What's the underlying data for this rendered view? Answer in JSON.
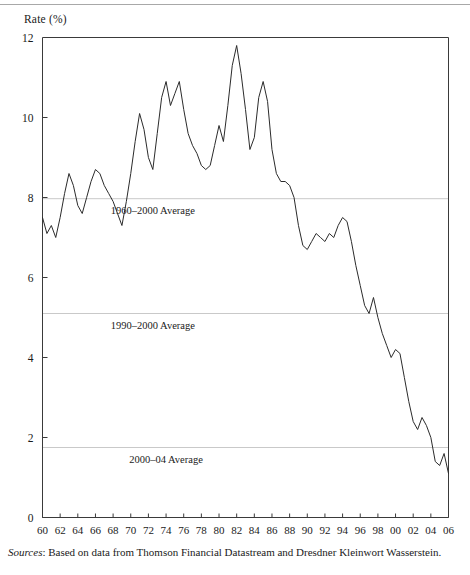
{
  "figure": {
    "y_axis_title": "Rate (%)",
    "source_label": "Sources",
    "source_separator": ": ",
    "source_text": "Based on data from Thomson Financial Datastream and Dresdner Kleinwort Wasserstein."
  },
  "chart_data": {
    "type": "line",
    "title": "",
    "subtitle": "",
    "xlabel": "",
    "ylabel": "Rate (%)",
    "xlim": [
      1960,
      2006
    ],
    "ylim": [
      0,
      12
    ],
    "grid": false,
    "legend_position": "none",
    "y_ticks": [
      0,
      2,
      4,
      6,
      8,
      10,
      12
    ],
    "y_tick_labels": [
      "0",
      "2",
      "4",
      "6",
      "8",
      "10",
      "12"
    ],
    "x_ticks": [
      1960,
      1962,
      1964,
      1966,
      1968,
      1970,
      1972,
      1974,
      1976,
      1978,
      1980,
      1982,
      1984,
      1986,
      1988,
      1990,
      1992,
      1994,
      1996,
      1998,
      2000,
      2002,
      2004,
      2006
    ],
    "x_tick_labels": [
      "60",
      "62",
      "64",
      "66",
      "68",
      "70",
      "72",
      "74",
      "76",
      "78",
      "80",
      "82",
      "84",
      "86",
      "88",
      "90",
      "92",
      "94",
      "96",
      "98",
      "00",
      "02",
      "04",
      "06"
    ],
    "line_color": "#2b2b2b",
    "reference_line_color": "#c9c9c9",
    "series": [
      {
        "name": "Rate",
        "x": [
          1960.0,
          1960.5,
          1961.0,
          1961.5,
          1962.0,
          1962.5,
          1963.0,
          1963.5,
          1964.0,
          1964.5,
          1965.0,
          1965.5,
          1966.0,
          1966.5,
          1967.0,
          1967.5,
          1968.0,
          1968.5,
          1969.0,
          1969.5,
          1970.0,
          1970.5,
          1971.0,
          1971.5,
          1972.0,
          1972.5,
          1973.0,
          1973.5,
          1974.0,
          1974.5,
          1975.0,
          1975.5,
          1976.0,
          1976.5,
          1977.0,
          1977.5,
          1978.0,
          1978.5,
          1979.0,
          1979.5,
          1980.0,
          1980.5,
          1981.0,
          1981.5,
          1982.0,
          1982.5,
          1983.0,
          1983.5,
          1984.0,
          1984.5,
          1985.0,
          1985.5,
          1986.0,
          1986.5,
          1987.0,
          1987.5,
          1988.0,
          1988.5,
          1989.0,
          1989.5,
          1990.0,
          1990.5,
          1991.0,
          1991.5,
          1992.0,
          1992.5,
          1993.0,
          1993.5,
          1994.0,
          1994.5,
          1995.0,
          1995.5,
          1996.0,
          1996.5,
          1997.0,
          1997.5,
          1998.0,
          1998.5,
          1999.0,
          1999.5,
          2000.0,
          2000.5,
          2001.0,
          2001.5,
          2002.0,
          2002.5,
          2003.0,
          2003.5,
          2004.0,
          2004.5,
          2005.0,
          2005.5,
          2006.0
        ],
        "y": [
          7.5,
          7.1,
          7.3,
          7.0,
          7.5,
          8.1,
          8.6,
          8.3,
          7.8,
          7.6,
          8.0,
          8.4,
          8.7,
          8.6,
          8.3,
          8.1,
          7.9,
          7.6,
          7.3,
          7.9,
          8.6,
          9.4,
          10.1,
          9.7,
          9.0,
          8.7,
          9.6,
          10.5,
          10.9,
          10.3,
          10.6,
          10.9,
          10.2,
          9.6,
          9.3,
          9.1,
          8.8,
          8.7,
          8.8,
          9.3,
          9.8,
          9.4,
          10.3,
          11.3,
          11.8,
          11.1,
          10.2,
          9.2,
          9.5,
          10.5,
          10.9,
          10.4,
          9.2,
          8.6,
          8.4,
          8.4,
          8.3,
          8.0,
          7.3,
          6.8,
          6.7,
          6.9,
          7.1,
          7.0,
          6.9,
          7.1,
          7.0,
          7.3,
          7.5,
          7.4,
          6.9,
          6.3,
          5.8,
          5.3,
          5.1,
          5.5,
          5.0,
          4.6,
          4.3,
          4.0,
          4.2,
          4.1,
          3.5,
          2.9,
          2.4,
          2.2,
          2.5,
          2.3,
          2.0,
          1.4,
          1.3,
          1.6,
          1.1
        ]
      }
    ],
    "reference_lines": [
      {
        "label": "1960–2000 Average",
        "value": 7.97,
        "label_x": 1972.5
      },
      {
        "label": "1990–2000 Average",
        "value": 5.1,
        "label_x": 1972.5
      },
      {
        "label": "2000–04 Average",
        "value": 1.75,
        "label_x": 1974.0
      }
    ]
  }
}
